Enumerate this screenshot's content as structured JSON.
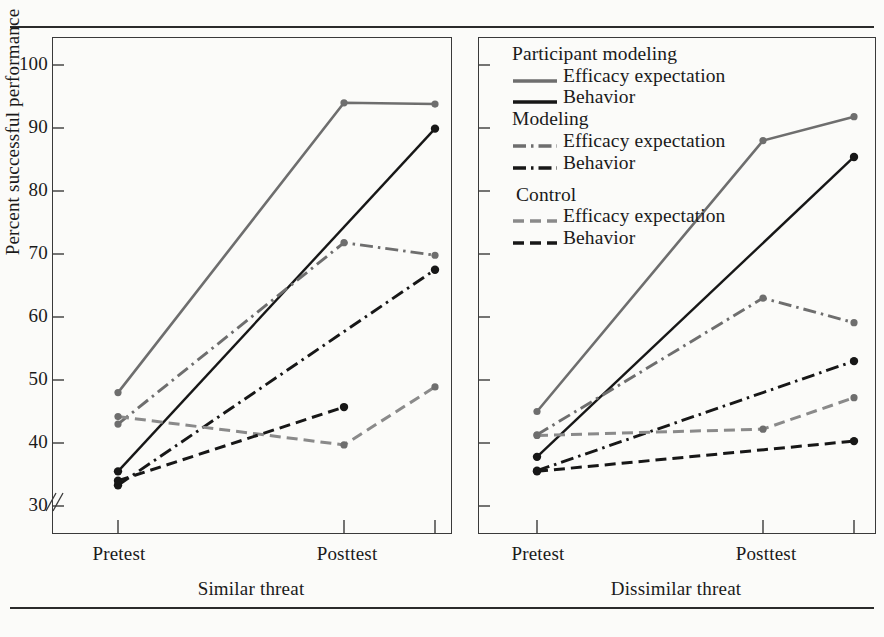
{
  "figure": {
    "clipped_caption_fragment": "",
    "y_axis_label": "Percent successful performance",
    "y_ticks": [
      30,
      40,
      50,
      60,
      70,
      80,
      90,
      100
    ],
    "y_min": 30,
    "y_max": 104,
    "axis_break": true,
    "x_tick_labels": [
      "Pretest",
      "Posttest"
    ],
    "panels": [
      {
        "id": "left",
        "title": "Similar threat"
      },
      {
        "id": "right",
        "title": "Dissimilar threat"
      }
    ]
  },
  "legend": {
    "groups": [
      {
        "name": "Participant modeling",
        "entries": [
          {
            "label": "Efficacy expectation",
            "style": "solid-gray",
            "color": "#6e6e6e"
          },
          {
            "label": "Behavior",
            "style": "solid-black",
            "color": "#171717"
          }
        ]
      },
      {
        "name": "Modeling",
        "entries": [
          {
            "label": "Efficacy expectation",
            "style": "dashdot-gray",
            "color": "#6e6e6e"
          },
          {
            "label": "Behavior",
            "style": "dashdot-black",
            "color": "#171717"
          }
        ]
      },
      {
        "name": "Control",
        "entries": [
          {
            "label": "Efficacy expectation",
            "style": "dashed-gray",
            "color": "#6e6e6e"
          },
          {
            "label": "Behavior",
            "style": "dashed-black",
            "color": "#171717"
          }
        ]
      }
    ]
  },
  "chart_data": {
    "type": "line",
    "title": "",
    "subtitle": "",
    "xlabel": "",
    "ylabel": "Percent successful performance",
    "ylim": [
      30,
      104
    ],
    "yticks": [
      30,
      40,
      50,
      60,
      70,
      80,
      90,
      100
    ],
    "grid": false,
    "legend_position": "top-right-inside",
    "axis_break_below": 30,
    "panels": [
      {
        "name": "Similar threat",
        "x": [
          "Pretest",
          "Posttest",
          "Posttest+"
        ],
        "x_tick_labels": [
          "Pretest",
          "Posttest"
        ],
        "series": [
          {
            "name": "Participant modeling - Efficacy expectation",
            "style": "solid-gray",
            "color": "#6e6e6e",
            "values": [
              48.0,
              94.0,
              93.8
            ]
          },
          {
            "name": "Participant modeling - Behavior",
            "style": "solid-black",
            "color": "#171717",
            "values": [
              35.5,
              null,
              89.9
            ]
          },
          {
            "name": "Modeling - Efficacy expectation",
            "style": "dashdot-gray",
            "color": "#6e6e6e",
            "values": [
              43.0,
              71.8,
              69.8
            ]
          },
          {
            "name": "Modeling - Behavior",
            "style": "dashdot-black",
            "color": "#171717",
            "values": [
              33.3,
              null,
              67.5
            ]
          },
          {
            "name": "Control - Efficacy expectation",
            "style": "dashed-gray",
            "color": "#6e6e6e",
            "values": [
              44.2,
              39.7,
              48.9
            ]
          },
          {
            "name": "Control - Behavior",
            "style": "dashed-black",
            "color": "#171717",
            "values": [
              34.0,
              45.7,
              null
            ]
          }
        ]
      },
      {
        "name": "Dissimilar threat",
        "x": [
          "Pretest",
          "Posttest",
          "Posttest+"
        ],
        "x_tick_labels": [
          "Pretest",
          "Posttest"
        ],
        "series": [
          {
            "name": "Participant modeling - Efficacy expectation",
            "style": "solid-gray",
            "color": "#6e6e6e",
            "values": [
              45.0,
              88.0,
              91.8
            ]
          },
          {
            "name": "Participant modeling - Behavior",
            "style": "solid-black",
            "color": "#171717",
            "values": [
              37.8,
              null,
              85.4
            ]
          },
          {
            "name": "Modeling - Efficacy expectation",
            "style": "dashdot-gray",
            "color": "#6e6e6e",
            "values": [
              41.3,
              63.0,
              59.1
            ]
          },
          {
            "name": "Modeling - Behavior",
            "style": "dashdot-black",
            "color": "#171717",
            "values": [
              35.6,
              null,
              53.0
            ]
          },
          {
            "name": "Control - Efficacy expectation",
            "style": "dashed-gray",
            "color": "#6e6e6e",
            "values": [
              41.2,
              42.2,
              47.2
            ]
          },
          {
            "name": "Control - Behavior",
            "style": "dashed-black",
            "color": "#171717",
            "values": [
              35.5,
              null,
              40.3
            ]
          }
        ]
      }
    ]
  }
}
